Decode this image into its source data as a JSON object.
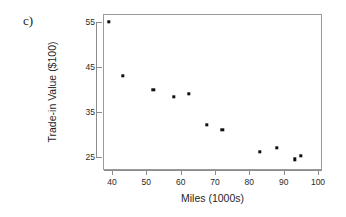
{
  "panel": {
    "letter": "c)"
  },
  "chart_data": {
    "type": "scatter",
    "title": "",
    "xlabel": "Miles (1000s)",
    "ylabel": "Trade-in Value ($100)",
    "xlim": [
      36,
      102
    ],
    "ylim": [
      22.5,
      56.5
    ],
    "xticks": [
      40,
      50,
      60,
      70,
      80,
      90,
      100
    ],
    "yticks": [
      25,
      35,
      45,
      55
    ],
    "xtick_labels": [
      "40",
      "50",
      "60",
      "70",
      "80",
      "90",
      "100"
    ],
    "ytick_labels": [
      "25",
      "35",
      "45",
      "55"
    ],
    "grid": false,
    "legend": false,
    "marker": "filled-square",
    "marker_color": "#101010",
    "frame_color": "#9a9a9a",
    "points": [
      {
        "x": 39.0,
        "y": 55.0
      },
      {
        "x": 43.2,
        "y": 43.0
      },
      {
        "x": 52.0,
        "y": 40.0
      },
      {
        "x": 58.0,
        "y": 38.4
      },
      {
        "x": 62.3,
        "y": 39.1
      },
      {
        "x": 67.6,
        "y": 32.1
      },
      {
        "x": 72.1,
        "y": 31.1
      },
      {
        "x": 83.0,
        "y": 26.1
      },
      {
        "x": 88.0,
        "y": 27.0
      },
      {
        "x": 93.2,
        "y": 24.5
      },
      {
        "x": 95.0,
        "y": 25.2
      }
    ]
  }
}
